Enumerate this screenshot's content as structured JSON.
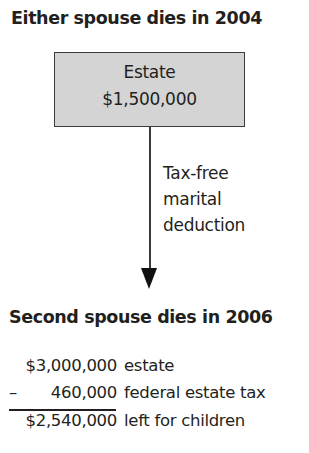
{
  "top": {
    "heading": "Either spouse dies in 2004",
    "box": {
      "line1": "Estate",
      "line2": "$1,500,000"
    }
  },
  "arrow": {
    "label_lines": [
      "Tax-free",
      "marital",
      "deduction"
    ]
  },
  "bottom": {
    "heading": "Second spouse dies in 2006",
    "rows": [
      {
        "sign": "",
        "amount": "$3,000,000",
        "description": "estate"
      },
      {
        "sign": "–",
        "amount": "460,000",
        "description": "federal estate tax"
      },
      {
        "sign": "",
        "amount": "$2,540,000",
        "description": "left for children"
      }
    ]
  },
  "colors": {
    "box_fill": "#d4d4d4",
    "text": "#231f20",
    "line": "#3a3a3a"
  }
}
